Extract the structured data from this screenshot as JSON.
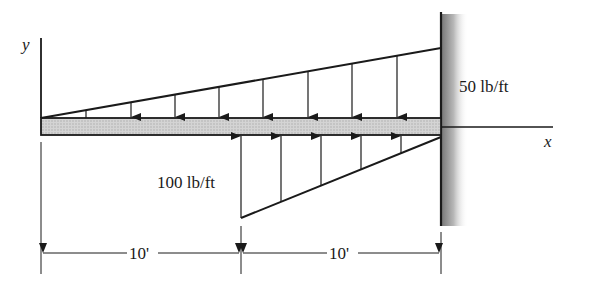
{
  "diagram": {
    "type": "cantilever-beam-distributed-load",
    "axes": {
      "y_label": "y",
      "x_label": "x"
    },
    "loads": {
      "top": {
        "label": "50 lb/ft",
        "direction": "down",
        "shape": "triangular",
        "max_at": "wall",
        "span_ft": 20
      },
      "bottom": {
        "label": "100 lb/ft",
        "direction": "up",
        "shape": "triangular",
        "max_at": "midspan",
        "span_ft": 10
      }
    },
    "dimensions": [
      {
        "label": "10'"
      },
      {
        "label": "10'"
      }
    ],
    "colors": {
      "line": "#1a1a1a",
      "beam_fill": "#c8c8c8",
      "wall_shade": "#8a8a8a"
    }
  }
}
